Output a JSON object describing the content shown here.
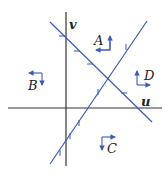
{
  "diagram": {
    "type": "phase-plane",
    "colors": {
      "axis": "#333333",
      "nullcline": "#3b5bb5",
      "arrow": "#3b5bb5",
      "text": "#222222"
    },
    "axes": {
      "horizontal_label": "u",
      "vertical_label": "v"
    },
    "nullclines": [
      {
        "name": "decreasing-line",
        "from": [
          50,
          22
        ],
        "to": [
          152,
          122
        ]
      },
      {
        "name": "increasing-line",
        "from": [
          50,
          164
        ],
        "to": [
          147,
          21
        ]
      }
    ],
    "regions": [
      {
        "id": "A",
        "label": "A",
        "direction": "left-up"
      },
      {
        "id": "B",
        "label": "B",
        "direction": "left-down"
      },
      {
        "id": "C",
        "label": "C",
        "direction": "right-down"
      },
      {
        "id": "D",
        "label": "D",
        "direction": "right-up"
      }
    ]
  }
}
